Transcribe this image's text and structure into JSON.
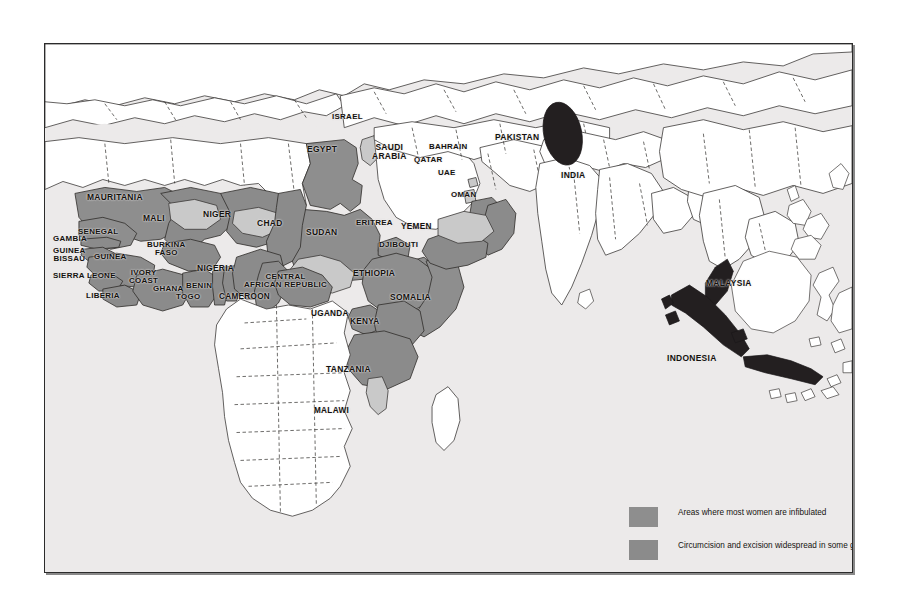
{
  "map": {
    "title": "Female genital mutilation distribution map",
    "background_color": "#eceaea",
    "frame_color": "#2b2b2b",
    "ocean_color": "#eceaea",
    "land_unshaded_color": "#ffffff",
    "border_line_color": "#3c3a38"
  },
  "colors": {
    "infibulated": "#8e8e8e",
    "widespread": "#8b8b8b",
    "some_cases": "#c9c9c9",
    "muslim_groups": "#231f20",
    "label_text": "#14120f"
  },
  "legend": {
    "items": [
      {
        "key": "infibulated",
        "color": "#8e8e8e",
        "label": "Areas where most women are infibulated"
      },
      {
        "key": "widespread",
        "color": "#8b8b8b",
        "label": "Circumcision and excision widespread in some groups"
      },
      {
        "key": "some_cases",
        "color": "#c9c9c9",
        "label": "Some cases reported"
      },
      {
        "key": "muslim_groups",
        "color": "#231f20",
        "label": "Circumcision practised by some Muslim population groups\n(The shading in Pakistan and India represents Bohra Muslims,\nnot exact location)"
      }
    ]
  },
  "labels": [
    {
      "name": "mauritania",
      "text": "MAURITANIA",
      "x": 86,
      "y": 192,
      "size": 6.6
    },
    {
      "name": "mali",
      "text": "MALI",
      "x": 142,
      "y": 213,
      "size": 6.6
    },
    {
      "name": "niger",
      "text": "NIGER",
      "x": 202,
      "y": 209,
      "size": 6.6
    },
    {
      "name": "chad",
      "text": "CHAD",
      "x": 256,
      "y": 218,
      "size": 6.6
    },
    {
      "name": "sudan",
      "text": "SUDAN",
      "x": 305,
      "y": 227,
      "size": 6.6
    },
    {
      "name": "egypt",
      "text": "EGYPT",
      "x": 306,
      "y": 144,
      "size": 6.6
    },
    {
      "name": "senegal",
      "text": "SENEGAL",
      "x": 77,
      "y": 227,
      "size": 6.2
    },
    {
      "name": "gambia",
      "text": "GAMBIA",
      "x": 52,
      "y": 234,
      "size": 6.2
    },
    {
      "name": "guinea-bissau",
      "text": "GUINEA\nBISSAU",
      "x": 52,
      "y": 246,
      "size": 6.2
    },
    {
      "name": "guinea",
      "text": "GUINEA",
      "x": 93,
      "y": 252,
      "size": 6.2
    },
    {
      "name": "sierra-leone",
      "text": "SIERRA LEONE",
      "x": 52,
      "y": 271,
      "size": 6.2
    },
    {
      "name": "liberia",
      "text": "LIBERIA",
      "x": 85,
      "y": 291,
      "size": 6.2
    },
    {
      "name": "burkina-faso",
      "text": "BURKINA\nFASO",
      "x": 146,
      "y": 240,
      "size": 6.2
    },
    {
      "name": "ivory-coast",
      "text": "IVORY\nCOAST",
      "x": 128,
      "y": 268,
      "size": 6.2
    },
    {
      "name": "ghana",
      "text": "GHANA",
      "x": 152,
      "y": 284,
      "size": 6.2
    },
    {
      "name": "togo",
      "text": "TOGO",
      "x": 175,
      "y": 292,
      "size": 6.2
    },
    {
      "name": "benin",
      "text": "BENIN",
      "x": 185,
      "y": 281,
      "size": 6.2
    },
    {
      "name": "nigeria",
      "text": "NIGERIA",
      "x": 196,
      "y": 263,
      "size": 6.6
    },
    {
      "name": "cameroon",
      "text": "CAMEROON",
      "x": 218,
      "y": 292,
      "size": 6.4
    },
    {
      "name": "central-african-republic",
      "text": "CENTRAL\nAFRICAN REPUBLIC",
      "x": 243,
      "y": 272,
      "size": 6.2
    },
    {
      "name": "eritrea",
      "text": "ERITREA",
      "x": 355,
      "y": 218,
      "size": 6.2
    },
    {
      "name": "djibouti",
      "text": "DJIBOUTI",
      "x": 378,
      "y": 240,
      "size": 6.2
    },
    {
      "name": "ethiopia",
      "text": "ETHIOPIA",
      "x": 352,
      "y": 268,
      "size": 6.6
    },
    {
      "name": "somalia",
      "text": "SOMALIA",
      "x": 389,
      "y": 292,
      "size": 6.6
    },
    {
      "name": "uganda",
      "text": "UGANDA",
      "x": 310,
      "y": 309,
      "size": 6.4
    },
    {
      "name": "kenya",
      "text": "KENYA",
      "x": 349,
      "y": 317,
      "size": 6.4
    },
    {
      "name": "tanzania",
      "text": "TANZANIA",
      "x": 325,
      "y": 364,
      "size": 6.6
    },
    {
      "name": "malawi",
      "text": "MALAWI",
      "x": 313,
      "y": 406,
      "size": 6.4
    },
    {
      "name": "israel",
      "text": "ISRAEL",
      "x": 331,
      "y": 112,
      "size": 6.2
    },
    {
      "name": "saudi-arabia",
      "text": "SAUDI\nARABIA",
      "x": 371,
      "y": 142,
      "size": 6.6
    },
    {
      "name": "bahrain",
      "text": "BAHRAIN",
      "x": 428,
      "y": 142,
      "size": 6.2
    },
    {
      "name": "qatar",
      "text": "QATAR",
      "x": 413,
      "y": 155,
      "size": 6.2
    },
    {
      "name": "uae",
      "text": "UAE",
      "x": 437,
      "y": 168,
      "size": 6.2
    },
    {
      "name": "oman",
      "text": "OMAN",
      "x": 450,
      "y": 190,
      "size": 6.2
    },
    {
      "name": "yemen",
      "text": "YEMEN",
      "x": 400,
      "y": 222,
      "size": 6.4
    },
    {
      "name": "pakistan",
      "text": "PAKISTAN",
      "x": 494,
      "y": 132,
      "size": 6.6
    },
    {
      "name": "india",
      "text": "INDIA",
      "x": 560,
      "y": 170,
      "size": 6.6
    },
    {
      "name": "malaysia",
      "text": "MALAYSIA",
      "x": 705,
      "y": 278,
      "size": 6.6
    },
    {
      "name": "indonesia",
      "text": "INDONESIA",
      "x": 666,
      "y": 353,
      "size": 6.6
    }
  ]
}
